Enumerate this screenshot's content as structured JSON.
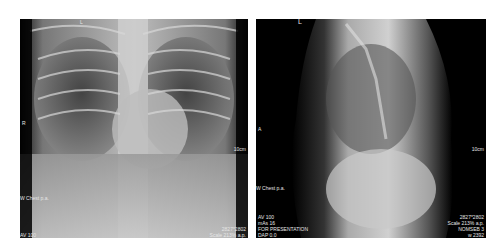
{
  "images": [
    {
      "view": "Chest PA (frontal)",
      "overlay": {
        "top_left": "L",
        "orientation_marker": "R",
        "scale_marker": "10cm",
        "series_label": "W Chest p.a.",
        "bottom_left": [
          "AV 100"
        ],
        "bottom_right": [
          "2827*2802",
          "Scale 213% a.p."
        ]
      }
    },
    {
      "view": "Chest lateral",
      "overlay": {
        "top_left": "L",
        "orientation_marker": "A",
        "scale_marker": "10cm",
        "series_label": "W Chest p.a.",
        "bottom_left": [
          "AV 100",
          "mAs 16",
          "FOR PRESENTATION",
          "DAP 0.0"
        ],
        "bottom_right": [
          "2827*2802",
          "Scale 213% a.p.",
          "NOMSEB 3",
          "w 2392"
        ]
      }
    }
  ]
}
